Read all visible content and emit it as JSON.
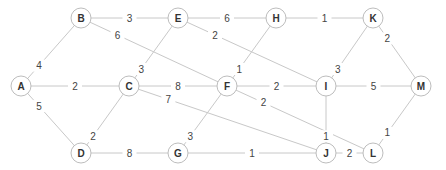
{
  "graph": {
    "type": "weighted-undirected-graph",
    "nodes": [
      {
        "id": "A",
        "x": 21,
        "y": 86
      },
      {
        "id": "B",
        "x": 81,
        "y": 18
      },
      {
        "id": "C",
        "x": 129,
        "y": 86
      },
      {
        "id": "D",
        "x": 81,
        "y": 153
      },
      {
        "id": "E",
        "x": 178,
        "y": 18
      },
      {
        "id": "F",
        "x": 227,
        "y": 86
      },
      {
        "id": "G",
        "x": 178,
        "y": 153
      },
      {
        "id": "H",
        "x": 276,
        "y": 18
      },
      {
        "id": "I",
        "x": 326,
        "y": 86
      },
      {
        "id": "J",
        "x": 326,
        "y": 153
      },
      {
        "id": "K",
        "x": 373,
        "y": 18
      },
      {
        "id": "L",
        "x": 373,
        "y": 153
      },
      {
        "id": "M",
        "x": 421,
        "y": 86
      }
    ],
    "edges": [
      {
        "from": "A",
        "to": "B",
        "weight": "4",
        "lt": 0.3
      },
      {
        "from": "A",
        "to": "C",
        "weight": "2",
        "lt": 0.5
      },
      {
        "from": "A",
        "to": "D",
        "weight": "5",
        "lt": 0.3
      },
      {
        "from": "B",
        "to": "E",
        "weight": "3",
        "lt": 0.5
      },
      {
        "from": "B",
        "to": "F",
        "weight": "6",
        "lt": 0.25
      },
      {
        "from": "C",
        "to": "E",
        "weight": "3",
        "lt": 0.25
      },
      {
        "from": "C",
        "to": "F",
        "weight": "8",
        "lt": 0.5
      },
      {
        "from": "C",
        "to": "J",
        "weight": "7",
        "lt": 0.2
      },
      {
        "from": "D",
        "to": "C",
        "weight": "2",
        "lt": 0.25
      },
      {
        "from": "D",
        "to": "G",
        "weight": "8",
        "lt": 0.5
      },
      {
        "from": "E",
        "to": "H",
        "weight": "6",
        "lt": 0.5
      },
      {
        "from": "E",
        "to": "I",
        "weight": "2",
        "lt": 0.25
      },
      {
        "from": "H",
        "to": "F",
        "weight": "1",
        "lt": 0.75
      },
      {
        "from": "H",
        "to": "K",
        "weight": "1",
        "lt": 0.5
      },
      {
        "from": "F",
        "to": "I",
        "weight": "2",
        "lt": 0.5
      },
      {
        "from": "F",
        "to": "L",
        "weight": "2",
        "lt": 0.25
      },
      {
        "from": "G",
        "to": "F",
        "weight": "3",
        "lt": 0.25
      },
      {
        "from": "G",
        "to": "J",
        "weight": "1",
        "lt": 0.5
      },
      {
        "from": "I",
        "to": "K",
        "weight": "3",
        "lt": 0.25
      },
      {
        "from": "I",
        "to": "M",
        "weight": "5",
        "lt": 0.5
      },
      {
        "from": "J",
        "to": "I",
        "weight": "1",
        "lt": 0.25
      },
      {
        "from": "J",
        "to": "L",
        "weight": "2",
        "lt": 0.5
      },
      {
        "from": "K",
        "to": "M",
        "weight": "2",
        "lt": 0.3
      },
      {
        "from": "L",
        "to": "M",
        "weight": "1",
        "lt": 0.3
      }
    ]
  }
}
